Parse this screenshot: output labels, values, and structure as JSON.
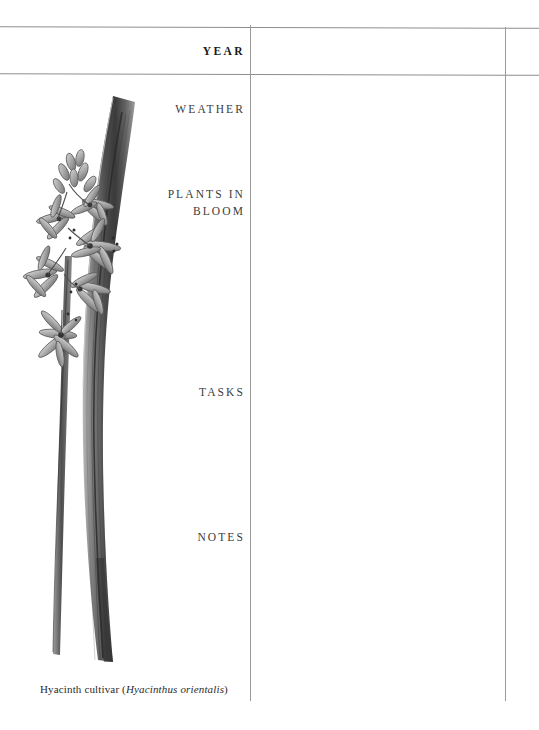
{
  "page": {
    "background_color": "#ffffff",
    "rule_color": "#8d8d8d"
  },
  "sections": [
    {
      "key": "year",
      "label": "YEAR",
      "emphasis": "bold"
    },
    {
      "key": "weather",
      "label": "WEATHER",
      "emphasis": "normal"
    },
    {
      "key": "plants",
      "label": "PLANTS IN\nBLOOM",
      "emphasis": "normal"
    },
    {
      "key": "tasks",
      "label": "TASKS",
      "emphasis": "normal"
    },
    {
      "key": "notes",
      "label": "NOTES",
      "emphasis": "normal"
    }
  ],
  "fields": {
    "year_value": "",
    "weather_value": "",
    "plants_value": "",
    "tasks_value": "",
    "notes_value": "",
    "margin_value": ""
  },
  "caption": {
    "common_name": "Hyacinth cultivar (",
    "scientific_name": "Hyacinthus orientalis",
    "close_paren": ")"
  },
  "illustration": {
    "name": "hyacinth-botanical-illustration",
    "subject": "Hyacinthus orientalis",
    "ink_color": "#4a4a4a",
    "leaf_color": "#5c5c5c",
    "parts": [
      "flower-raceme",
      "stem",
      "strap-leaf"
    ]
  }
}
